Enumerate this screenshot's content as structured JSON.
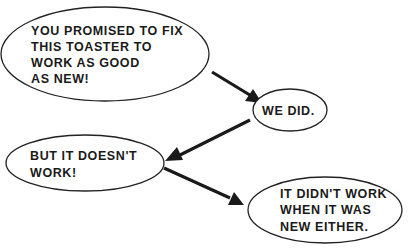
{
  "diagram": {
    "nodes": [
      {
        "id": "customer-1",
        "lines": [
          "YOU PROMISED TO FIX",
          "THIS TOASTER TO",
          "WORK AS GOOD",
          "AS NEW!"
        ]
      },
      {
        "id": "repair-1",
        "lines": [
          "WE DID."
        ]
      },
      {
        "id": "customer-2",
        "lines": [
          "BUT IT DOESN'T",
          "WORK!"
        ]
      },
      {
        "id": "repair-2",
        "lines": [
          "IT DIDN'T WORK",
          "WHEN IT WAS",
          "NEW EITHER."
        ]
      }
    ],
    "edges": [
      {
        "from": "customer-1",
        "to": "repair-1"
      },
      {
        "from": "repair-1",
        "to": "customer-2"
      },
      {
        "from": "customer-2",
        "to": "repair-2"
      }
    ],
    "colors": {
      "ink": "#1a1a1a",
      "background": "#ffffff"
    }
  }
}
